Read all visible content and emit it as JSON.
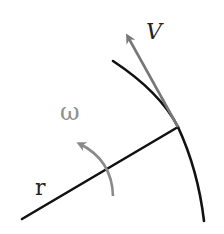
{
  "diagram": {
    "labels": {
      "velocity": "V",
      "angular_velocity": "ω",
      "radius": "r"
    },
    "colors": {
      "path": "#111111",
      "radius": "#111111",
      "velocity_arrow": "#777777",
      "angular_arrow": "#8a8a8a",
      "label_dark": "#222222",
      "label_omega": "#8f8f8f",
      "background": "#ffffff"
    }
  }
}
